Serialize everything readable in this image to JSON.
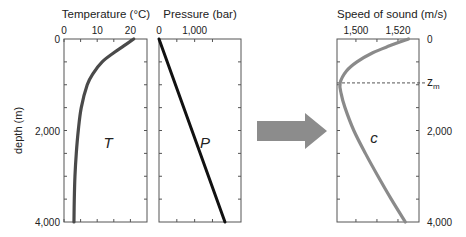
{
  "chart_data": [
    {
      "type": "line",
      "id": "temperature",
      "title": "Temperature (°C)",
      "xlabel": "Temperature (°C)",
      "ylabel": "depth (m)",
      "xlim": [
        0,
        25
      ],
      "ylim": [
        0,
        4000
      ],
      "x_tick_labels": [
        {
          "v": 0,
          "t": "0"
        },
        {
          "v": 10,
          "t": "10"
        },
        {
          "v": 20,
          "t": "20"
        }
      ],
      "x_ticks": [
        0,
        5,
        10,
        15,
        20
      ],
      "y_tick_labels": [
        {
          "v": 0,
          "t": "0"
        },
        {
          "v": 2000,
          "t": "2,000"
        },
        {
          "v": 4000,
          "t": "4,000"
        }
      ],
      "y_ticks": [
        500,
        1000,
        1500,
        2000,
        2500,
        3000,
        3500
      ],
      "annotation": "T",
      "color": "#4a4a4a",
      "series": [
        {
          "name": "T",
          "depth": [
            0,
            150,
            300,
            500,
            750,
            1000,
            1500,
            2000,
            2500,
            3000,
            3500,
            4000
          ],
          "values": [
            21,
            18,
            15,
            11.5,
            8.8,
            7,
            5.2,
            4.3,
            3.7,
            3.3,
            3.1,
            3
          ]
        }
      ]
    },
    {
      "type": "line",
      "id": "pressure",
      "title": "Pressure (bar)",
      "xlabel": "Pressure (bar)",
      "xlim": [
        0,
        2300
      ],
      "ylim": [
        0,
        4000
      ],
      "x_tick_labels": [
        {
          "v": 0,
          "t": "0"
        },
        {
          "v": 1000,
          "t": "1,000"
        }
      ],
      "x_ticks": [
        500,
        1000,
        1500
      ],
      "y_ticks": [
        500,
        1000,
        1500,
        2000,
        2500,
        3000,
        3500
      ],
      "annotation": "P",
      "color": "#111111",
      "series": [
        {
          "name": "P",
          "depth": [
            0,
            4000
          ],
          "values": [
            0,
            1850
          ]
        }
      ]
    },
    {
      "type": "line",
      "id": "sound-speed",
      "title": "Speed of sound (m/s)",
      "xlabel": "Speed of sound (m/s)",
      "xlim": [
        1491,
        1530
      ],
      "ylim": [
        0,
        4000
      ],
      "x_tick_labels": [
        {
          "v": 1500,
          "t": "1,500"
        },
        {
          "v": 1520,
          "t": "1,520"
        }
      ],
      "x_ticks": [
        1500,
        1510,
        1520
      ],
      "y_tick_labels": [
        {
          "v": 0,
          "t": "0"
        },
        {
          "v": 2000,
          "t": "2,000"
        },
        {
          "v": 4000,
          "t": "4,000"
        }
      ],
      "y_ticks": [
        500,
        1000,
        1500,
        2000,
        2500,
        3000,
        3500
      ],
      "annotation": "c",
      "min_depth_label": "z",
      "min_depth_subscript": "m",
      "min_depth": 960,
      "color": "#8a8a8a",
      "series": [
        {
          "name": "c",
          "depth": [
            0,
            150,
            300,
            500,
            700,
            960,
            1200,
            1500,
            2000,
            2500,
            3000,
            3500,
            4000
          ],
          "values": [
            1525,
            1516,
            1508,
            1500.5,
            1495.5,
            1492.5,
            1493,
            1494.8,
            1499,
            1504.5,
            1510.5,
            1516.8,
            1523.5
          ]
        }
      ]
    }
  ],
  "arrow": {
    "direction": "right",
    "color": "#8c8c8c"
  }
}
